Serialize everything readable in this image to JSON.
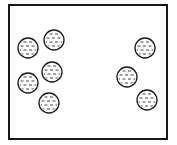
{
  "diagram": {
    "container": {
      "x": 9,
      "y": 5,
      "width": 158,
      "height": 134,
      "stroke": "#1a1a1a",
      "stroke_width": 2,
      "fill": "#ffffff"
    },
    "particle_style": {
      "radius": 10,
      "stroke": "#1a1a1a",
      "stroke_width": 1.3,
      "fill": "#ffffff",
      "pattern": "dashes",
      "dash_color": "#333333"
    },
    "particles": [
      {
        "id": "left-1",
        "group": "left",
        "cx": 28,
        "cy": 48
      },
      {
        "id": "left-2",
        "group": "left",
        "cx": 54,
        "cy": 40
      },
      {
        "id": "left-3",
        "group": "left",
        "cx": 52,
        "cy": 72
      },
      {
        "id": "left-4",
        "group": "left",
        "cx": 28,
        "cy": 83
      },
      {
        "id": "left-5",
        "group": "left",
        "cx": 49,
        "cy": 103
      },
      {
        "id": "right-1",
        "group": "right",
        "cx": 145,
        "cy": 48
      },
      {
        "id": "right-2",
        "group": "right",
        "cx": 127,
        "cy": 77
      },
      {
        "id": "right-3",
        "group": "right",
        "cx": 147,
        "cy": 100
      }
    ],
    "counts": {
      "left": 5,
      "right": 3,
      "total": 8
    }
  }
}
